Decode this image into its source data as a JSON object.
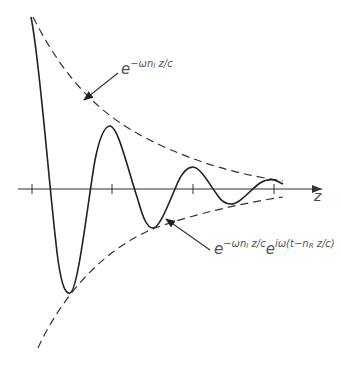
{
  "diagram": {
    "type": "damped-wave",
    "axis": {
      "label": "z"
    },
    "labels": {
      "envelope": {
        "base": "e",
        "exp_prefix": "−ωn",
        "exp_sub": "I",
        "exp_suffix": " z/c"
      },
      "wave": {
        "base1": "e",
        "exp1_prefix": "−ωn",
        "exp1_sub": "I",
        "exp1_suffix": " z/c",
        "base2": "e",
        "exp2_prefix": "iω(t−n",
        "exp2_sub": "R",
        "exp2_suffix": " z/c)"
      }
    },
    "colors": {
      "stroke": "#222222",
      "label": "#555555"
    }
  }
}
